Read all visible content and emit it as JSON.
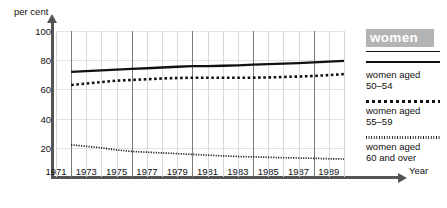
{
  "chart_data": {
    "type": "line",
    "title": "",
    "xlabel": "Year",
    "ylabel": "per cent",
    "xlim": [
      1971,
      1990
    ],
    "ylim": [
      0,
      100
    ],
    "yticks": [
      20,
      40,
      60,
      80,
      100
    ],
    "xticks": [
      1971,
      1973,
      1975,
      1977,
      1979,
      1981,
      1983,
      1985,
      1987,
      1989
    ],
    "grid": "vertical major every 4 years, light minor gridlines each year",
    "legend_position": "right",
    "legend_title": "women",
    "x": [
      1972,
      1973,
      1974,
      1975,
      1976,
      1977,
      1978,
      1979,
      1980,
      1981,
      1982,
      1983,
      1984,
      1985,
      1986,
      1987,
      1988,
      1989,
      1990
    ],
    "series": [
      {
        "name": "women aged\n50–54",
        "style": "solid",
        "values": [
          72,
          72.5,
          73,
          73.5,
          74,
          74.5,
          75,
          75.5,
          76,
          76,
          76.2,
          76.5,
          77,
          77.3,
          77.6,
          78,
          78.5,
          79,
          79.5
        ]
      },
      {
        "name": "women aged\n55–59",
        "style": "coarse-dotted",
        "values": [
          63,
          64,
          65,
          66,
          66.5,
          67,
          67.5,
          67.8,
          68,
          68,
          68,
          68,
          68,
          68.2,
          68.5,
          68.8,
          69.2,
          69.8,
          70.5
        ]
      },
      {
        "name": "women aged\n60 and over",
        "style": "fine-dotted",
        "values": [
          22,
          21,
          20,
          18.5,
          17.5,
          17,
          16.5,
          16,
          15.5,
          15,
          14.5,
          14,
          13.8,
          13.5,
          13.2,
          13,
          12.8,
          12.5,
          12.3
        ]
      }
    ]
  },
  "axes": {
    "ylabel": "per cent",
    "xlabel": "Year",
    "yticks": [
      "100",
      "80",
      "60",
      "40",
      "20"
    ],
    "xticks": [
      "1971",
      "1973",
      "1975",
      "1977",
      "1979",
      "1981",
      "1983",
      "1985",
      "1987",
      "1989"
    ]
  },
  "legend": {
    "badge": "women",
    "entries": [
      {
        "label": "women aged\n50–54",
        "style": "solid"
      },
      {
        "label": "women aged\n55–59",
        "style": "coarse-dotted"
      },
      {
        "label": "women aged\n60 and over",
        "style": "fine-dotted"
      }
    ]
  }
}
